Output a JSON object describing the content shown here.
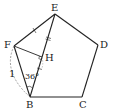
{
  "figure": {
    "type": "geometry",
    "points": {
      "E": {
        "label": "E",
        "x": 55,
        "y": 14
      },
      "D": {
        "label": "D",
        "x": 98,
        "y": 45
      },
      "C": {
        "label": "C",
        "x": 82,
        "y": 97
      },
      "B": {
        "label": "B",
        "x": 30,
        "y": 97
      },
      "F": {
        "label": "F",
        "x": 14,
        "y": 46
      },
      "H": {
        "label": "H",
        "x": 42,
        "y": 57
      }
    },
    "annotations": {
      "side_length": "1",
      "angle": "36°"
    },
    "colors": {
      "line": "#222222",
      "dashed": "#888888"
    }
  }
}
